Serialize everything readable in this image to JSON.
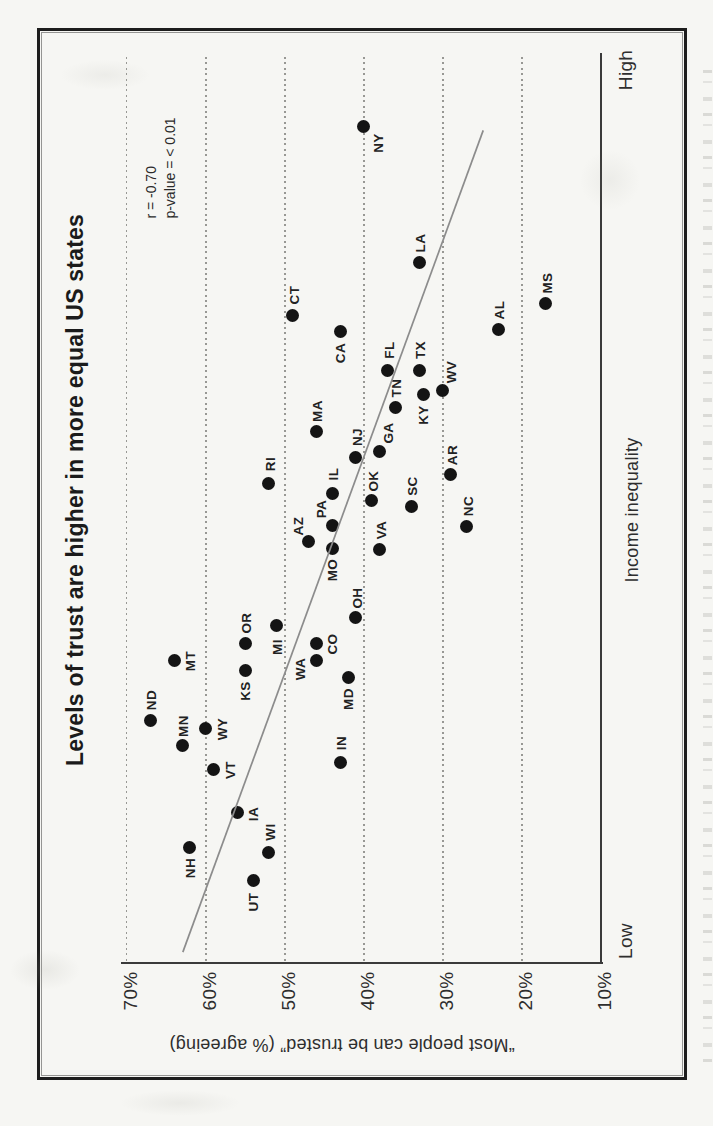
{
  "chart_data": {
    "type": "scatter",
    "title": "Levels of trust are higher in more equal US states",
    "xlabel": "Income inequality",
    "ylabel": "“Most people can be trusted” (% agreeing)",
    "x_range_labels": [
      "Low",
      "High"
    ],
    "y_tick_labels": [
      "70%",
      "60%",
      "50%",
      "40%",
      "30%",
      "20%",
      "10%"
    ],
    "y_ticks_percent": [
      70,
      60,
      50,
      40,
      30,
      20,
      10
    ],
    "ylim": [
      10,
      70
    ],
    "grid": "dotted vertical rules at each 10% trust level",
    "orientation": "figure printed rotated 90° counter-clockwise on portrait page",
    "annotation": {
      "correlation": "r = -0.70",
      "p_value": "p-value = < 0.01"
    },
    "trendline": {
      "ineq1": 0.012,
      "trust1": 62.9,
      "ineq2": 0.919,
      "trust2": 24.9
    },
    "points": [
      {
        "state": "NY",
        "inequality": 0.923,
        "trust_pct": 40,
        "label_pos": "below-right"
      },
      {
        "state": "LA",
        "inequality": 0.773,
        "trust_pct": 33,
        "label_pos": "above"
      },
      {
        "state": "MS",
        "inequality": 0.728,
        "trust_pct": 17,
        "label_pos": "above"
      },
      {
        "state": "CT",
        "inequality": 0.715,
        "trust_pct": 49,
        "label_pos": "above"
      },
      {
        "state": "AL",
        "inequality": 0.699,
        "trust_pct": 23,
        "label_pos": "above"
      },
      {
        "state": "CA",
        "inequality": 0.697,
        "trust_pct": 43,
        "label_pos": "below"
      },
      {
        "state": "FL",
        "inequality": 0.654,
        "trust_pct": 37,
        "label_pos": "above"
      },
      {
        "state": "TX",
        "inequality": 0.654,
        "trust_pct": 33,
        "label_pos": "above"
      },
      {
        "state": "WV",
        "inequality": 0.632,
        "trust_pct": 30,
        "label_pos": "above-right"
      },
      {
        "state": "KY",
        "inequality": 0.628,
        "trust_pct": 32.5,
        "label_pos": "below"
      },
      {
        "state": "TN",
        "inequality": 0.613,
        "trust_pct": 36,
        "label_pos": "above"
      },
      {
        "state": "MA",
        "inequality": 0.587,
        "trust_pct": 46,
        "label_pos": "above"
      },
      {
        "state": "GA",
        "inequality": 0.565,
        "trust_pct": 38,
        "label_pos": "above-right"
      },
      {
        "state": "NJ",
        "inequality": 0.558,
        "trust_pct": 41,
        "label_pos": "above"
      },
      {
        "state": "AR",
        "inequality": 0.539,
        "trust_pct": 29,
        "label_pos": "above"
      },
      {
        "state": "RI",
        "inequality": 0.529,
        "trust_pct": 52,
        "label_pos": "above"
      },
      {
        "state": "IL",
        "inequality": 0.518,
        "trust_pct": 44,
        "label_pos": "above"
      },
      {
        "state": "OK",
        "inequality": 0.51,
        "trust_pct": 39,
        "label_pos": "above"
      },
      {
        "state": "SC",
        "inequality": 0.504,
        "trust_pct": 34,
        "label_pos": "above"
      },
      {
        "state": "PA",
        "inequality": 0.483,
        "trust_pct": 44,
        "label_pos": "above-left"
      },
      {
        "state": "NC",
        "inequality": 0.482,
        "trust_pct": 27,
        "label_pos": "above"
      },
      {
        "state": "AZ",
        "inequality": 0.465,
        "trust_pct": 47,
        "label_pos": "above-left"
      },
      {
        "state": "MO",
        "inequality": 0.457,
        "trust_pct": 44,
        "label_pos": "below"
      },
      {
        "state": "VA",
        "inequality": 0.456,
        "trust_pct": 38,
        "label_pos": "above"
      },
      {
        "state": "OH",
        "inequality": 0.381,
        "trust_pct": 41,
        "label_pos": "above"
      },
      {
        "state": "MI",
        "inequality": 0.372,
        "trust_pct": 51,
        "label_pos": "below"
      },
      {
        "state": "OR",
        "inequality": 0.353,
        "trust_pct": 55,
        "label_pos": "above"
      },
      {
        "state": "CO",
        "inequality": 0.353,
        "trust_pct": 46,
        "label_pos": "right"
      },
      {
        "state": "WA",
        "inequality": 0.334,
        "trust_pct": 46,
        "label_pos": "left-below"
      },
      {
        "state": "MT",
        "inequality": 0.334,
        "trust_pct": 64,
        "label_pos": "right"
      },
      {
        "state": "KS",
        "inequality": 0.323,
        "trust_pct": 55,
        "label_pos": "below"
      },
      {
        "state": "MD",
        "inequality": 0.315,
        "trust_pct": 42,
        "label_pos": "below"
      },
      {
        "state": "ND",
        "inequality": 0.268,
        "trust_pct": 67,
        "label_pos": "above"
      },
      {
        "state": "WY",
        "inequality": 0.259,
        "trust_pct": 60,
        "label_pos": "right"
      },
      {
        "state": "MN",
        "inequality": 0.24,
        "trust_pct": 63,
        "label_pos": "above"
      },
      {
        "state": "IN",
        "inequality": 0.221,
        "trust_pct": 43,
        "label_pos": "above"
      },
      {
        "state": "VT",
        "inequality": 0.214,
        "trust_pct": 59,
        "label_pos": "right"
      },
      {
        "state": "IA",
        "inequality": 0.166,
        "trust_pct": 56,
        "label_pos": "right"
      },
      {
        "state": "NH",
        "inequality": 0.128,
        "trust_pct": 62,
        "label_pos": "below"
      },
      {
        "state": "WI",
        "inequality": 0.122,
        "trust_pct": 52,
        "label_pos": "above"
      },
      {
        "state": "UT",
        "inequality": 0.091,
        "trust_pct": 54,
        "label_pos": "below"
      }
    ]
  }
}
